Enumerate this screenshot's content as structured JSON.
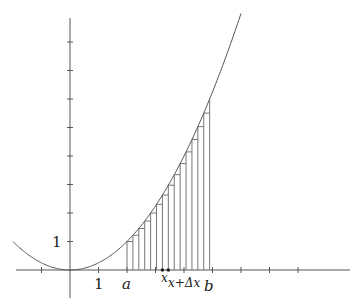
{
  "figure": {
    "function": "y = x^2 / 4",
    "x_range": [
      -2,
      6
    ],
    "origin_px": [
      70,
      270
    ],
    "unit_px": 28.5,
    "partition": {
      "a": 2,
      "b": 4.9,
      "n_strips": 14
    },
    "labels": {
      "y_one": "1",
      "x_one": "1",
      "a": "a",
      "x": "x",
      "x_plus_dx": "x+Δx",
      "b": "b"
    },
    "x_ticks": [
      -1,
      1,
      2,
      3,
      4,
      5,
      6,
      7,
      8
    ],
    "y_ticks": [
      1,
      2,
      3,
      4,
      5,
      6,
      7,
      8
    ],
    "marked_points": [
      "x",
      "x+Δx"
    ],
    "colors": {
      "axis": "#555555",
      "curve": "#555555",
      "strips": "#777777",
      "text": "#222222"
    }
  }
}
